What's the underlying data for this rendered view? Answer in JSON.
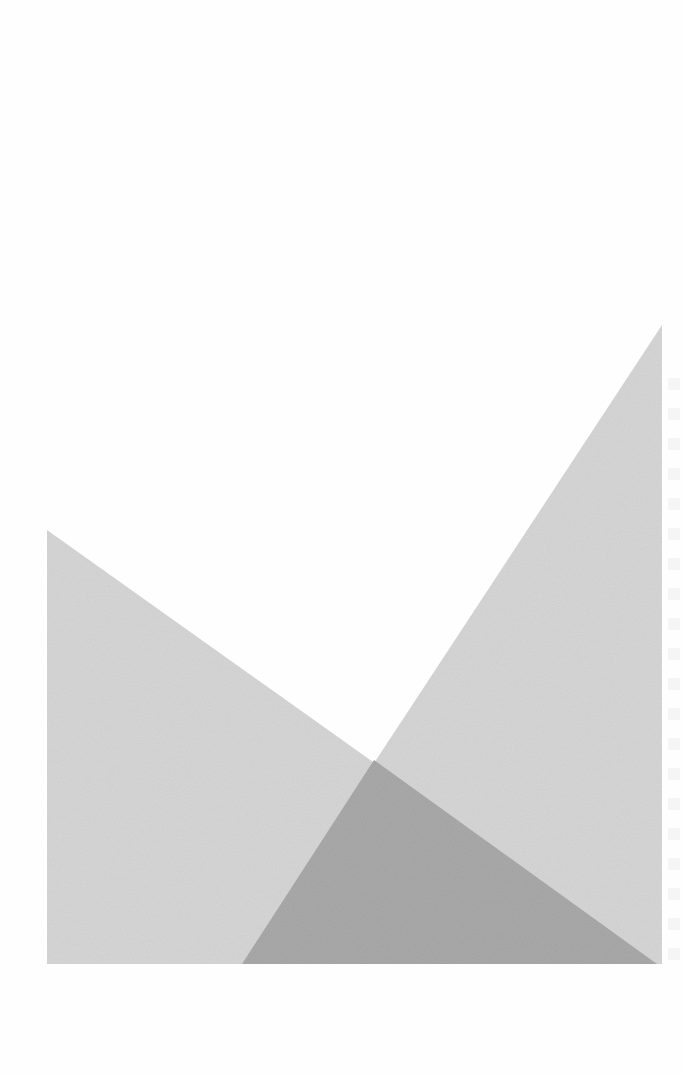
{
  "page": {
    "type": "scanned-page",
    "background_color": "#fefefe"
  },
  "graphic": {
    "description": "Two overlapping grey triangles forming a V shape",
    "colors": {
      "light_fill": "#d6d6d6",
      "overlap_fill": "#a9a9a9"
    },
    "left_triangle": {
      "points": [
        [
          47,
          530
        ],
        [
          47,
          964
        ],
        [
          657,
          964
        ]
      ]
    },
    "right_triangle": {
      "points": [
        [
          662,
          325
        ],
        [
          662,
          964
        ],
        [
          242,
          964
        ]
      ]
    },
    "overlap_triangle": {
      "points": [
        [
          374,
          760
        ],
        [
          242,
          964
        ],
        [
          657,
          964
        ]
      ]
    }
  }
}
